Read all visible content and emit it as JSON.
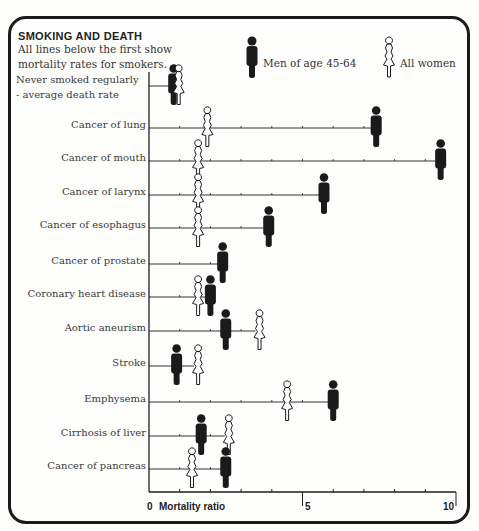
{
  "header": {
    "title": "SMOKING AND DEATH",
    "subtitle": "All lines below the first show mortality rates for smokers."
  },
  "legend": {
    "men_label": "Men of age 45-64",
    "women_label": "All women",
    "men_color": "#1a1a1a",
    "women_color": "#ffffff"
  },
  "axis": {
    "zero_label": "0",
    "title": "Mortality ratio",
    "mid_label": "5",
    "max_label": "10"
  },
  "chart_data": {
    "type": "scatter",
    "title": "SMOKING AND DEATH",
    "subtitle": "All lines below the first show mortality rates for smokers.",
    "xlabel": "Mortality ratio",
    "ylabel": "",
    "xlim": [
      0,
      10
    ],
    "x_ticks": [
      0,
      5,
      10
    ],
    "grid": false,
    "legend_position": "top-right",
    "categories": [
      "Never smoked regularly - average death rate",
      "Cancer of lung",
      "Cancer of mouth",
      "Cancer of larynx",
      "Cancer of esophagus",
      "Cancer of prostate",
      "Coronary heart disease",
      "Aortic aneurism",
      "Stroke",
      "Emphysema",
      "Cirrhosis of liver",
      "Cancer of pancreas"
    ],
    "series": [
      {
        "name": "Men of age 45-64",
        "values": [
          1.0,
          7.4,
          9.5,
          5.7,
          3.9,
          2.4,
          2.0,
          2.5,
          0.9,
          6.0,
          1.7,
          2.5
        ]
      },
      {
        "name": "All women",
        "values": [
          1.0,
          1.9,
          1.6,
          1.6,
          1.6,
          null,
          1.6,
          3.6,
          1.6,
          4.5,
          2.6,
          1.4
        ]
      }
    ]
  }
}
